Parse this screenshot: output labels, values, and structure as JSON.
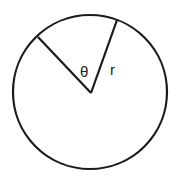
{
  "diagram": {
    "type": "circle-sector",
    "labels": {
      "angle": "θ",
      "radius": "r"
    },
    "colors": {
      "stroke": "#1a1a1a",
      "background": "#ffffff"
    }
  }
}
